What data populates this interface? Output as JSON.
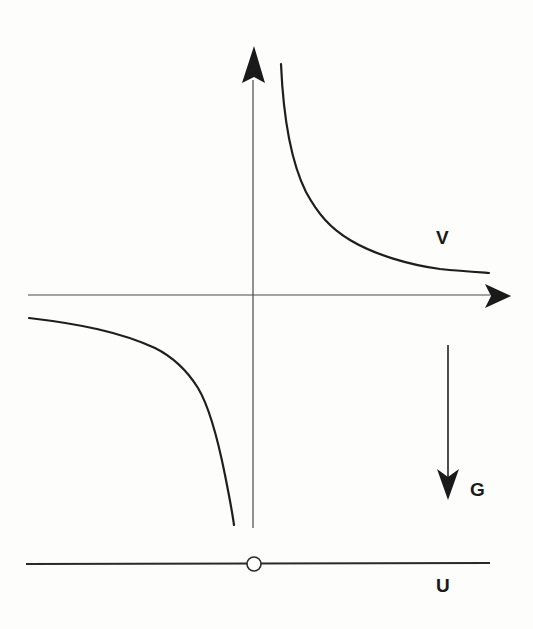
{
  "diagram": {
    "type": "potential-and-force schematic",
    "background_color": "#fdfdfb",
    "line_color": "#1e1e1e",
    "labels": {
      "potential_curve": "V",
      "force_vector": "G",
      "baseline": "U"
    },
    "axes": {
      "origin_px": [
        253,
        295
      ],
      "vertical_axis": {
        "x": 253,
        "y_top_tip": 46,
        "y_bottom": 528,
        "arrow": "up"
      },
      "horizontal_axis": {
        "y": 295,
        "x_left": 28,
        "x_right_tip": 510,
        "arrow": "right"
      }
    },
    "curves": [
      {
        "name": "potential-curve-right-branch",
        "label": "V",
        "points": [
          [
            281,
            64
          ],
          [
            285,
            110
          ],
          [
            295,
            160
          ],
          [
            306,
            192
          ],
          [
            335,
            230
          ],
          [
            380,
            255
          ],
          [
            430,
            268
          ],
          [
            489,
            273
          ]
        ]
      },
      {
        "name": "potential-curve-left-branch",
        "points": [
          [
            29,
            318
          ],
          [
            80,
            324
          ],
          [
            120,
            333
          ],
          [
            155,
            348
          ],
          [
            180,
            370
          ],
          [
            195,
            383
          ],
          [
            207,
            400
          ],
          [
            218,
            440
          ],
          [
            227,
            480
          ],
          [
            234,
            525
          ]
        ]
      }
    ],
    "force_arrow": {
      "label": "G",
      "x": 448,
      "y_start": 345,
      "y_tip": 500,
      "direction": "down"
    },
    "baseline": {
      "label": "U",
      "y": 564,
      "x_left": 26,
      "x_right": 490,
      "marker": {
        "type": "open-circle",
        "center": [
          254,
          564
        ],
        "radius": 7
      }
    }
  }
}
